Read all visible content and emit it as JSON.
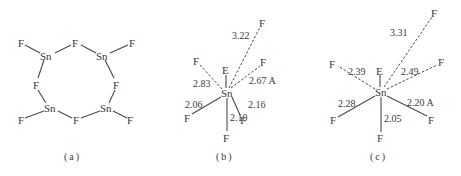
{
  "figure": {
    "panels": [
      {
        "id": "a",
        "caption": "(a)",
        "description": "Sn4F8 ring: four Sn atoms bridged by F, each with one terminal F",
        "atoms": {
          "f_tl": "F",
          "sn_tl": "Sn",
          "f_top": "F",
          "sn_tr": "Sn",
          "f_tr": "F",
          "f_ml": "F",
          "f_mr": "F",
          "sn_bl": "Sn",
          "f_bl": "F",
          "f_bot": "F",
          "sn_br": "Sn",
          "f_br": "F"
        }
      },
      {
        "id": "b",
        "caption": "(b)",
        "center": "Sn",
        "lone_pair": "E",
        "ligands": [
          {
            "atom": "F",
            "distance": "3.22",
            "type": "dashed",
            "direction": "top"
          },
          {
            "atom": "F",
            "distance": "2.83",
            "type": "dashed",
            "direction": "upper-left"
          },
          {
            "atom": "F",
            "distance": "2.67 A",
            "type": "dashed",
            "direction": "upper-right"
          },
          {
            "atom": "F",
            "distance": "2.06",
            "type": "solid",
            "direction": "lower-left"
          },
          {
            "atom": "F",
            "distance": "2.10",
            "type": "solid",
            "direction": "bottom"
          },
          {
            "atom": "F",
            "distance": "2.16",
            "type": "solid",
            "direction": "lower-right"
          }
        ]
      },
      {
        "id": "c",
        "caption": "(c)",
        "center": "Sn",
        "lone_pair": "E",
        "ligands": [
          {
            "atom": "F",
            "distance": "3.31",
            "type": "dashed",
            "direction": "top"
          },
          {
            "atom": "F",
            "distance": "2.39",
            "type": "dashed",
            "direction": "upper-left"
          },
          {
            "atom": "F",
            "distance": "2.49",
            "type": "dashed",
            "direction": "upper-right"
          },
          {
            "atom": "F",
            "distance": "2.28",
            "type": "solid",
            "direction": "lower-left"
          },
          {
            "atom": "F",
            "distance": "2.05",
            "type": "solid",
            "direction": "bottom"
          },
          {
            "atom": "F",
            "distance": "2.20 A",
            "type": "solid",
            "direction": "lower-right"
          }
        ]
      }
    ]
  }
}
